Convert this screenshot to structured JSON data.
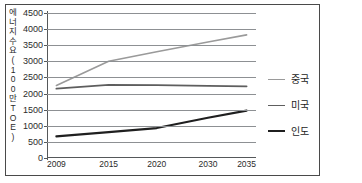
{
  "chart_data": {
    "type": "line",
    "title": "",
    "subtitle": "",
    "xlabel": "",
    "ylabel": "에너지 수요(100만 TOE)",
    "ylabel_chars": [
      "에",
      "너",
      "지",
      "수",
      "요",
      "(",
      "1",
      "0",
      "0",
      "만",
      "T",
      "O",
      "E",
      ")"
    ],
    "categories": [
      "2009",
      "2015",
      "2020",
      "2030",
      "2035"
    ],
    "x_positions_pct": [
      4.5,
      29.5,
      52.5,
      77.0,
      95.5
    ],
    "ylim": [
      0,
      4500
    ],
    "yticks": [
      0,
      500,
      1000,
      1500,
      2000,
      2500,
      3000,
      3500,
      4000,
      4500
    ],
    "ytick_labels": [
      "0",
      "500",
      "1000",
      "1500",
      "2000",
      "2500",
      "3000",
      "3500",
      "4000",
      "4500"
    ],
    "grid": true,
    "grid_axis": "y",
    "legend_position": "right",
    "series": [
      {
        "name": "중국",
        "color": "#9a9a9a",
        "width": 1.6,
        "values": [
          2250,
          3000,
          3300,
          3600,
          3820
        ]
      },
      {
        "name": "미국",
        "color": "#5e5e5e",
        "width": 1.8,
        "values": [
          2150,
          2270,
          2260,
          2240,
          2225
        ]
      },
      {
        "name": "인도",
        "color": "#1f1f1f",
        "width": 2.2,
        "values": [
          670,
          800,
          930,
          1250,
          1470
        ]
      }
    ]
  },
  "legend": {
    "items": [
      {
        "label": "중국",
        "color": "#9a9a9a",
        "width": 1.6
      },
      {
        "label": "미국",
        "color": "#5e5e5e",
        "width": 1.8
      },
      {
        "label": "인도",
        "color": "#1f1f1f",
        "width": 2.2
      }
    ]
  },
  "colors": {
    "frame": "#4a4a4a",
    "grid": "#8d9093",
    "axis": "#55585a",
    "text": "#2b2b2b",
    "background": "#ffffff"
  }
}
